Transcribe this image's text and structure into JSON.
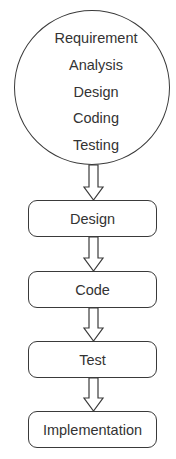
{
  "diagram": {
    "type": "flowchart",
    "direction": "top-to-bottom",
    "stroke_color": "#3a3a3a",
    "text_color": "#333333",
    "background": "#ffffff",
    "phase_circle": {
      "lines": [
        "Requirement",
        "Analysis",
        "Design",
        "Coding",
        "Testing"
      ]
    },
    "steps": [
      {
        "label": "Design"
      },
      {
        "label": "Code"
      },
      {
        "label": "Test"
      },
      {
        "label": "Implementation"
      }
    ],
    "arrows": [
      {
        "from": "phase_circle",
        "to": "Design"
      },
      {
        "from": "Design",
        "to": "Code"
      },
      {
        "from": "Code",
        "to": "Test"
      },
      {
        "from": "Test",
        "to": "Implementation"
      }
    ]
  }
}
